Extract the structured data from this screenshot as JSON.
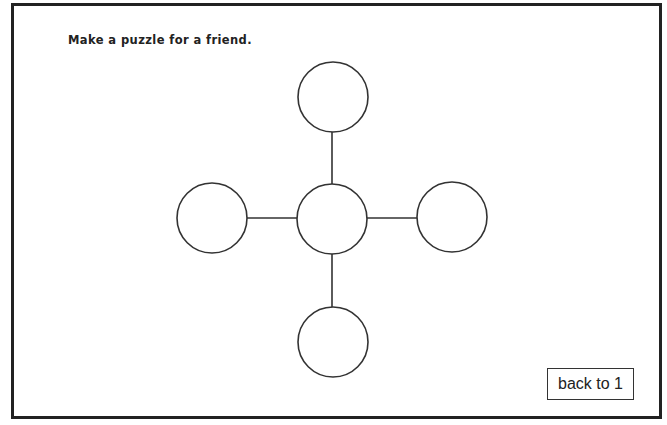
{
  "instruction": "Make a puzzle for a friend.",
  "puzzle": {
    "nodes": [
      {
        "id": "top",
        "cx": 333,
        "cy": 97,
        "r": 35,
        "value": ""
      },
      {
        "id": "left",
        "cx": 212,
        "cy": 218,
        "r": 35,
        "value": ""
      },
      {
        "id": "center",
        "cx": 332,
        "cy": 219,
        "r": 35,
        "value": ""
      },
      {
        "id": "right",
        "cx": 452,
        "cy": 217,
        "r": 35,
        "value": ""
      },
      {
        "id": "bottom",
        "cx": 333,
        "cy": 342,
        "r": 35,
        "value": ""
      }
    ],
    "edges": [
      {
        "from": "top",
        "to": "center"
      },
      {
        "from": "left",
        "to": "center"
      },
      {
        "from": "center",
        "to": "right"
      },
      {
        "from": "center",
        "to": "bottom"
      }
    ],
    "stroke_color": "#333333"
  },
  "buttons": {
    "back": "back to 1"
  },
  "colors": {
    "frame_border": "#222222",
    "background": "#ffffff",
    "text": "#222222"
  }
}
